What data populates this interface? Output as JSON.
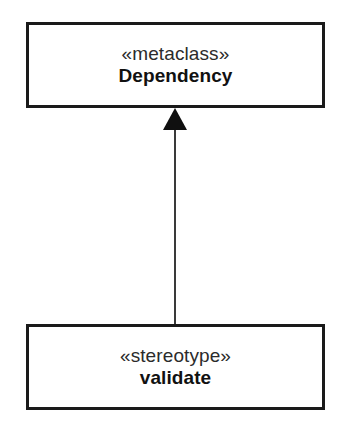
{
  "diagram": {
    "type": "uml-class-diagram",
    "background_color": "#ffffff",
    "line_color": "#1a1a1a",
    "text_color": "#111111",
    "nodes": [
      {
        "id": "metaclass-dependency",
        "role": "metaclass",
        "stereotype_label": "«metaclass»",
        "name": "Dependency",
        "name_weight": "bold",
        "x": 26,
        "y": 22,
        "width": 299,
        "height": 86
      },
      {
        "id": "stereotype-validate",
        "role": "stereotype",
        "stereotype_label": "«stereotype»",
        "name": "validate",
        "name_weight": "bold",
        "x": 26,
        "y": 324,
        "width": 299,
        "height": 86
      }
    ],
    "connectors": [
      {
        "id": "generalization-1",
        "kind": "generalization",
        "from": "stereotype-validate",
        "to": "metaclass-dependency",
        "style": "solid",
        "arrowhead": "filled-triangle",
        "arrowhead_at": "metaclass-dependency"
      }
    ]
  }
}
